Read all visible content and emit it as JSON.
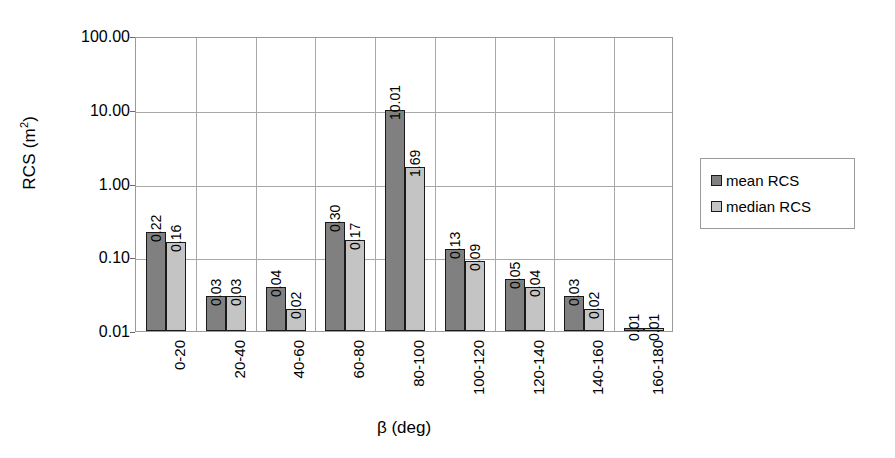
{
  "chart_data": {
    "type": "bar",
    "title": "",
    "xlabel": "β (deg)",
    "ylabel": "RCS (m²)",
    "ylabel_base": "RCS (m",
    "ylabel_sup": "2",
    "ylabel_close": ")",
    "yscale": "log",
    "ylim": [
      0.01,
      100
    ],
    "ytick_labels": [
      "100.00",
      "10.00",
      "1.00",
      "0.10",
      "0.01"
    ],
    "ytick_values": [
      100,
      10,
      1,
      0.1,
      0.01
    ],
    "grid": true,
    "legend_position": "right",
    "categories": [
      "0-20",
      "20-40",
      "40-60",
      "60-80",
      "80-100",
      "100-120",
      "120-140",
      "140-160",
      "160-180"
    ],
    "series": [
      {
        "name": "mean RCS",
        "color": "#808080",
        "values": [
          0.22,
          0.03,
          0.04,
          0.3,
          10.01,
          0.13,
          0.05,
          0.03,
          0.01
        ],
        "labels": [
          "0.22",
          "0.03",
          "0.04",
          "0.30",
          "10.01",
          "0.13",
          "0.05",
          "0.03",
          "0.01"
        ]
      },
      {
        "name": "median RCS",
        "color": "#c4c4c4",
        "values": [
          0.16,
          0.03,
          0.02,
          0.17,
          1.69,
          0.09,
          0.04,
          0.02,
          0.01
        ],
        "labels": [
          "0.16",
          "0.03",
          "0.02",
          "0.17",
          "1.69",
          "0.09",
          "0.04",
          "0.02",
          "0.01"
        ]
      }
    ]
  },
  "legend": {
    "items": [
      {
        "label": "mean RCS",
        "color": "#808080"
      },
      {
        "label": "median RCS",
        "color": "#c4c4c4"
      }
    ]
  },
  "colors": {
    "mean": "#808080",
    "median": "#c4c4c4",
    "grid": "#a8a8a8",
    "frame": "#9a9a9a",
    "bar_border": "#1a1a1a",
    "background": "#ffffff"
  }
}
